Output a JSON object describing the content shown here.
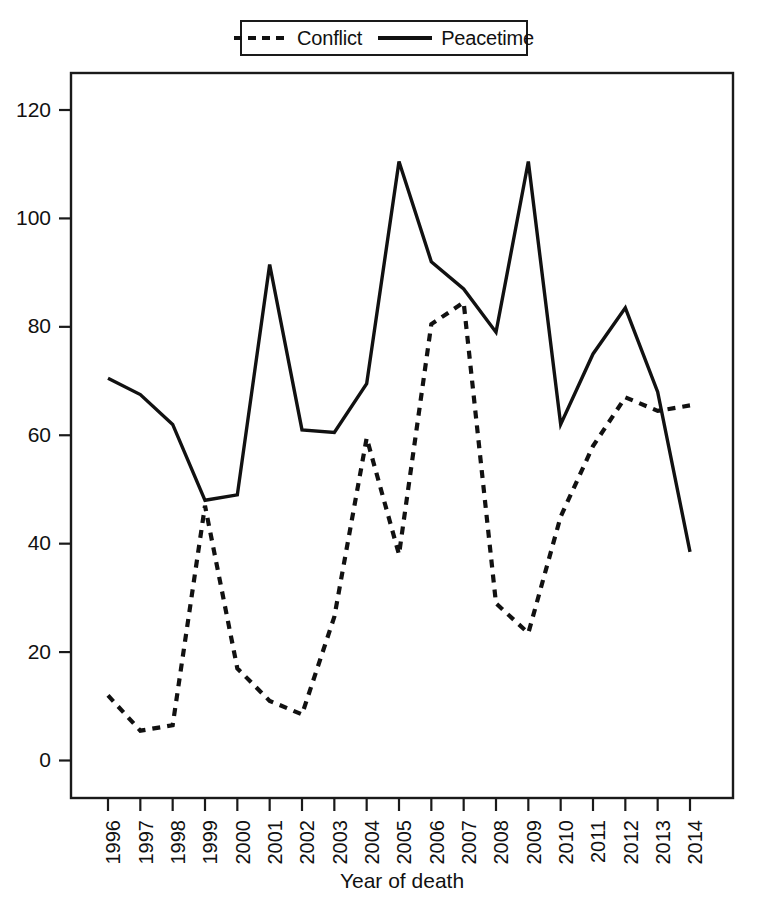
{
  "legend": {
    "position": "top-center",
    "entries": [
      {
        "label": "Conflict",
        "style": "dashed",
        "swatch_name": "legend-swatch-conflict"
      },
      {
        "label": "Peacetime",
        "style": "solid",
        "swatch_name": "legend-swatch-peacetime"
      }
    ]
  },
  "colors": {
    "line": "#111111",
    "axis": "#1a1a1a",
    "background": "#ffffff"
  },
  "chart_data": {
    "type": "line",
    "title": "",
    "subtitle": "",
    "xlabel": "Year of death",
    "ylabel": "",
    "grid": false,
    "legend_position": "top-center",
    "xlim": [
      1995.4,
      2014.6
    ],
    "ylim": [
      -6,
      126
    ],
    "yticks": [
      0,
      20,
      40,
      60,
      80,
      100,
      120
    ],
    "ytick_labels": [
      "0",
      "20",
      "40",
      "60",
      "80",
      "100",
      "120"
    ],
    "x": [
      1996,
      1997,
      1998,
      1999,
      2000,
      2001,
      2002,
      2003,
      2004,
      2005,
      2006,
      2007,
      2008,
      2009,
      2010,
      2011,
      2012,
      2013,
      2014
    ],
    "categories": [
      "1996",
      "1997",
      "1998",
      "1999",
      "2000",
      "2001",
      "2002",
      "2003",
      "2004",
      "2005",
      "2006",
      "2007",
      "2008",
      "2009",
      "2010",
      "2011",
      "2012",
      "2013",
      "2014"
    ],
    "series": [
      {
        "name": "Conflict",
        "style": "dashed",
        "values": [
          12,
          5.5,
          6.5,
          47,
          17,
          11,
          8.5,
          26.5,
          59.5,
          38,
          80.5,
          84.5,
          29,
          23.5,
          45,
          58,
          67,
          64.5,
          65.5
        ]
      },
      {
        "name": "Peacetime",
        "style": "solid",
        "values": [
          70.5,
          67.5,
          62,
          48,
          49,
          91.5,
          61,
          60.5,
          69.5,
          110.5,
          92,
          87,
          79,
          110.5,
          62,
          75,
          83.5,
          68,
          38.5
        ]
      }
    ]
  }
}
